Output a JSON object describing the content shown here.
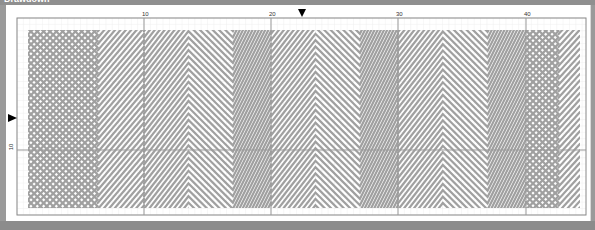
{
  "window": {
    "title": "Drawdown"
  },
  "ruler": {
    "columns": [
      {
        "label": "10",
        "x": 144
      },
      {
        "label": "20",
        "x": 271
      },
      {
        "label": "30",
        "x": 398
      },
      {
        "label": "40",
        "x": 526
      }
    ],
    "rows": [
      {
        "label": "10",
        "y": 150
      }
    ]
  },
  "markers": {
    "column_marker_x": 302,
    "row_marker_y": 118
  },
  "grid": {
    "left": 17,
    "top": 18,
    "right": 586,
    "bottom": 215,
    "cell": 6.35,
    "major_every": 20,
    "line_color": "#999999",
    "minor_color": "#eeeeee",
    "stroke_color": "#a0a0a0"
  },
  "pattern": {
    "description": "Diagonal twill drawdown with chevron and maze-like reversals",
    "blocks": [
      {
        "x0": 28,
        "x1": 144,
        "type": "chevron-down",
        "apexY": 130
      },
      {
        "x0": 144,
        "x1": 271,
        "type": "maze",
        "apexY": 120
      },
      {
        "x0": 271,
        "x1": 398,
        "type": "maze",
        "apexY": 110
      },
      {
        "x0": 398,
        "x1": 526,
        "type": "maze",
        "apexY": 95
      },
      {
        "x0": 526,
        "x1": 580,
        "type": "chevron-up",
        "apexY": 120
      }
    ]
  }
}
